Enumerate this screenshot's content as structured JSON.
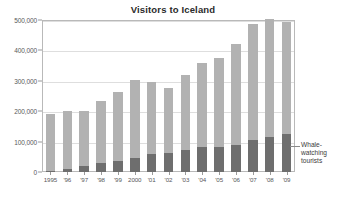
{
  "chart_data": {
    "type": "bar",
    "title": "Visitors to Iceland",
    "subtitle": "",
    "xlabel": "",
    "ylabel": "",
    "stacked": true,
    "grid": true,
    "legend_position": "annotation-right",
    "ylim": [
      0,
      500000
    ],
    "ytick_values": [
      0,
      100000,
      200000,
      300000,
      400000,
      500000
    ],
    "ytick_labels": [
      "0",
      "100,000",
      "200,000",
      "300,000",
      "400,000",
      "500,000"
    ],
    "categories": [
      "1995",
      "'96",
      "'97",
      "'98",
      "'99",
      "2000",
      "'01",
      "'02",
      "'03",
      "'04",
      "'05",
      "'06",
      "'07",
      "'08",
      "'09"
    ],
    "series": [
      {
        "name": "Total visitors",
        "color": "#b2b2b2",
        "values": [
          190000,
          201000,
          202000,
          232000,
          263000,
          303000,
          296000,
          277000,
          320000,
          360000,
          374000,
          422000,
          486000,
          502000,
          494000
        ]
      },
      {
        "name": "Whale-watching tourists",
        "color": "#6e6e6e",
        "values": [
          2000,
          9000,
          20000,
          30000,
          35000,
          46000,
          60000,
          62000,
          72000,
          82000,
          82000,
          90000,
          105000,
          115000,
          126000
        ]
      }
    ],
    "annotations": [
      {
        "name": "whale-watching-callout",
        "lines": [
          "Whale-",
          "watching",
          "tourists"
        ],
        "target_category": "'09",
        "target_series": "Whale-watching tourists"
      }
    ],
    "colors": {
      "total_bar": "#b2b2b2",
      "whale_bar": "#6e6e6e",
      "gridline": "#dedede",
      "frame": "#b9b9b9",
      "axis_text": "#58585a",
      "title_text": "#2b2b2b",
      "background": "#ffffff"
    }
  }
}
